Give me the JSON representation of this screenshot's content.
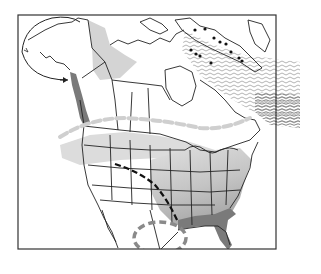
{
  "map": {
    "type": "range-map",
    "region": "North America",
    "frame": {
      "x": 18,
      "y": 15,
      "width": 258,
      "height": 234,
      "stroke": "#333333"
    },
    "colors": {
      "background": "#ffffff",
      "land_outline": "#222222",
      "light_range": "#d4d4d4",
      "medium_range": "#b8b8b8",
      "dark_range": "#7a7a7a",
      "dashed_boundary": "#cfcfcf",
      "migration_route": "#111111",
      "wintering_circle": "#8a8a8a",
      "ocean_wave_lines": "#a0a0a0",
      "colony_dots": "#111111"
    },
    "layers": [
      {
        "name": "alaska-inset-circle",
        "description": "Alaska inset with arrow pointing to Pacific coast"
      },
      {
        "name": "pacific-coast-dark-range",
        "description": "Dark shaded coastal strip, British Columbia to Washington"
      },
      {
        "name": "northern-light-range",
        "description": "Light shaded area in Yukon/NWT"
      },
      {
        "name": "arctic-colony-dots",
        "description": "Black dots along Baffin Island coast"
      },
      {
        "name": "atlantic-wave-range",
        "description": "Wavy-line band across Labrador Sea / North Atlantic"
      },
      {
        "name": "dashed-range-boundary",
        "description": "Light gray dashed line across southern Canada"
      },
      {
        "name": "eastern-gradient-range",
        "description": "Shaded eastern US gradient, darker toward Gulf coast"
      },
      {
        "name": "gulf-coast-dark-range",
        "description": "Dark shading along Gulf coast and Florida"
      },
      {
        "name": "migration-dashed-line",
        "description": "Black dashed line from Montana to Louisiana"
      },
      {
        "name": "mexico-wintering-loop",
        "description": "Gray dashed ellipse over northeastern Mexico"
      }
    ]
  }
}
